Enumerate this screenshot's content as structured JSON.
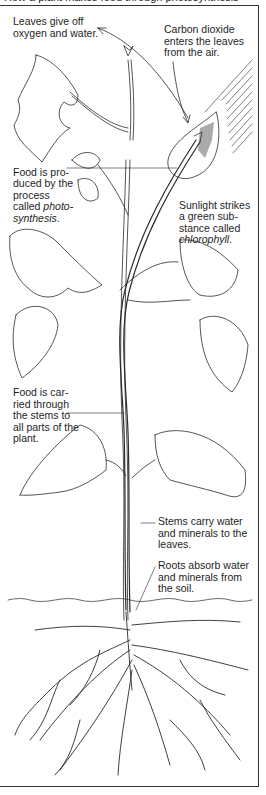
{
  "diagram": {
    "cut_title": "How a plant makes food through photosynthesis",
    "labels": [
      {
        "id": "leaves-give-off",
        "text": "Leaves give off\noxygen and water.",
        "x": 13,
        "y": 16
      },
      {
        "id": "carbon-dioxide",
        "text": "Carbon dioxide\nenters the leaves\nfrom the air.",
        "x": 164,
        "y": 24
      },
      {
        "id": "food-produced",
        "text": "Food is pro-\nduced by the\nprocess\ncalled ",
        "italic": "photo-\nsynthesis",
        "tail": ".",
        "x": 13,
        "y": 155
      },
      {
        "id": "sunlight",
        "text": "Sunlight strikes\na green sub-\nstance called\n",
        "italic": "chlorophyll",
        "tail": ".",
        "x": 179,
        "y": 188
      },
      {
        "id": "food-carried",
        "text": "Food is car-\nried through\nthe stems to\nall parts of the\nplant.",
        "x": 13,
        "y": 387
      },
      {
        "id": "stems-carry",
        "text": "Stems carry water\nand minerals to the\nleaves.",
        "x": 158,
        "y": 516
      },
      {
        "id": "roots-absorb",
        "text": "Roots absorb water\nand minerals from\nthe soil.",
        "x": 158,
        "y": 560
      }
    ],
    "colors": {
      "line": "#2a2a2a",
      "background": "#ffffff",
      "frame": "#333333"
    }
  }
}
